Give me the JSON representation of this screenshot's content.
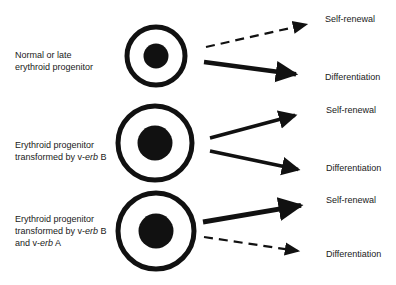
{
  "diagram": {
    "rows": [
      {
        "id": "normal",
        "label_lines": [
          {
            "pre": "Normal or late",
            "ital": "",
            "post": ""
          },
          {
            "pre": "erythroid progenitor",
            "ital": "",
            "post": ""
          }
        ],
        "cell": {
          "cx": 156,
          "cy": 56,
          "r_outer": 29,
          "r_inner": 12.5
        },
        "arrows": {
          "self_renewal": {
            "label": "Self-renewal",
            "style": "dashed",
            "weight": "thin",
            "from": [
              206,
              47
            ],
            "to": [
              313,
              23
            ]
          },
          "differentiation": {
            "label": "Differentiation",
            "style": "solid",
            "weight": "thick",
            "from": [
              204,
              62
            ],
            "to": [
              309,
              76
            ]
          }
        }
      },
      {
        "id": "verbB",
        "label_lines": [
          {
            "pre": "Erythroid progenitor",
            "ital": "",
            "post": ""
          },
          {
            "pre": "transformed by v-",
            "ital": "erb",
            "post": " B"
          }
        ],
        "cell": {
          "cx": 155,
          "cy": 143,
          "r_outer": 37,
          "r_inner": 17.5
        },
        "arrows": {
          "self_renewal": {
            "label": "Self-renewal",
            "style": "solid",
            "weight": "medium",
            "from": [
              210,
              138
            ],
            "to": [
              307,
              112
            ]
          },
          "differentiation": {
            "label": "Differentiation",
            "style": "solid",
            "weight": "medium",
            "from": [
              210,
              151
            ],
            "to": [
              310,
              172
            ]
          }
        }
      },
      {
        "id": "verbBA",
        "label_lines": [
          {
            "pre": "Erythroid progenitor",
            "ital": "",
            "post": ""
          },
          {
            "pre": "transformed by v-",
            "ital": "erb",
            "post": " B"
          },
          {
            "pre": "and v-",
            "ital": "erb",
            "post": " A"
          }
        ],
        "cell": {
          "cx": 156,
          "cy": 231,
          "r_outer": 38,
          "r_inner": 17.5
        },
        "arrows": {
          "self_renewal": {
            "label": "Self-renewal",
            "style": "solid",
            "weight": "thick",
            "from": [
              203,
              222
            ],
            "to": [
              315,
              203
            ]
          },
          "differentiation": {
            "label": "Differentiation",
            "style": "dashed",
            "weight": "thin",
            "from": [
              204,
              237
            ],
            "to": [
              305,
              252
            ]
          }
        }
      }
    ],
    "outcome_labels": {
      "self_renewal": "Self-renewal",
      "differentiation": "Differentiation"
    },
    "colors": {
      "ink": "#111111",
      "background": "#ffffff"
    }
  }
}
